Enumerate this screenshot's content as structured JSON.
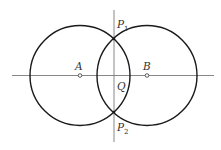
{
  "diagram": {
    "colors": {
      "circle": "#1a1a1a",
      "axis": "#7a7a7a",
      "point": "#333333",
      "label": "#333333",
      "background": "#ffffff"
    },
    "circles": [
      {
        "name": "circle-A",
        "center_label": "A",
        "cx": 80,
        "cy": 75.5,
        "r": 50
      },
      {
        "name": "circle-B",
        "center_label": "B",
        "cx": 147,
        "cy": 75.5,
        "r": 50
      }
    ],
    "lines": {
      "horizontal": {
        "x1": 12,
        "y1": 75.5,
        "x2": 214,
        "y2": 75.5
      },
      "vertical": {
        "x1": 114,
        "y1": 10,
        "x2": 114,
        "y2": 142
      }
    },
    "points": {
      "A": {
        "label": "A",
        "x": 80,
        "y": 75.5
      },
      "B": {
        "label": "B",
        "x": 147,
        "y": 75.5
      },
      "P1": {
        "label": "P",
        "subscript": "1",
        "x": 114,
        "y": 39
      },
      "P2": {
        "label": "P",
        "subscript": "2",
        "x": 114,
        "y": 112
      },
      "Q": {
        "label": "Q",
        "x": 114,
        "y": 75.5
      }
    }
  }
}
